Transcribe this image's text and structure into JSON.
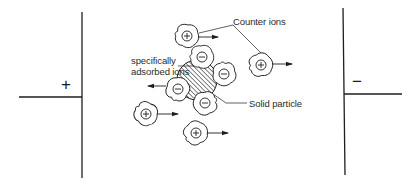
{
  "diagram": {
    "colors": {
      "ink": "#1e1e1e",
      "background": "#ffffff"
    },
    "electrodes": {
      "positive": {
        "symbol": "+"
      },
      "negative": {
        "symbol": "−"
      }
    },
    "labels": {
      "counter_ions": "Counter ions",
      "adsorbed_ions_line1": "specifically",
      "adsorbed_ions_line2": "adsorbed ions",
      "solid_particle": "Solid particle"
    },
    "ion_symbols": {
      "positive": "⊕",
      "negative": "⊖"
    },
    "particle": {
      "cx": 197,
      "cy": 80,
      "r": 20
    },
    "adsorbed_ions": [
      {
        "id": "top",
        "cx": 202,
        "cy": 57,
        "charge": "negative"
      },
      {
        "id": "right",
        "cx": 224,
        "cy": 74,
        "charge": "negative"
      },
      {
        "id": "left",
        "cx": 178,
        "cy": 89,
        "charge": "negative"
      },
      {
        "id": "bottom",
        "cx": 205,
        "cy": 103,
        "charge": "negative"
      }
    ],
    "counter_ions": [
      {
        "id": "c1",
        "cx": 187,
        "cy": 36,
        "charge": "positive"
      },
      {
        "id": "c2",
        "cx": 261,
        "cy": 65,
        "charge": "positive"
      },
      {
        "id": "c3",
        "cx": 146,
        "cy": 114,
        "charge": "positive"
      },
      {
        "id": "c4",
        "cx": 196,
        "cy": 133,
        "charge": "positive"
      }
    ]
  }
}
